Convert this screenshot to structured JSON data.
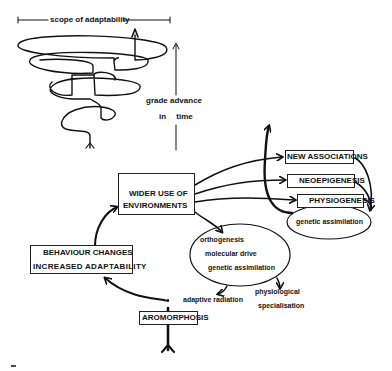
{
  "diagram": {
    "spiral": {
      "scope_label": "scope of adaptability",
      "grade_label_line1": "grade advance",
      "grade_label_line2": "in time"
    },
    "nodes": {
      "wider_use_line1": "WIDER USE OF",
      "wider_use_line2": "ENVIRONMENTS",
      "behaviour_line1": "BEHAVIOUR CHANGES",
      "behaviour_line2": "INCREASED ADAPTABILITY",
      "aromorphosis": "AROMORPHOSIS",
      "new_associations": "NEW ASSOCIATIONS",
      "neoepigenesis": "NEOEPIGENESIS",
      "physiogenesis": "PHYSIOGENESIS",
      "genetic_assimilation_right": "genetic assimilation",
      "oval_items": [
        "orthogenesis",
        "molecular drive",
        "genetic assimilation"
      ],
      "adaptive_radiation": "adaptive radiation",
      "physiological_line1": "physiological",
      "physiological_line2": "specialisation"
    },
    "colors": {
      "ink": "#111111",
      "background": "#ffffff"
    }
  }
}
